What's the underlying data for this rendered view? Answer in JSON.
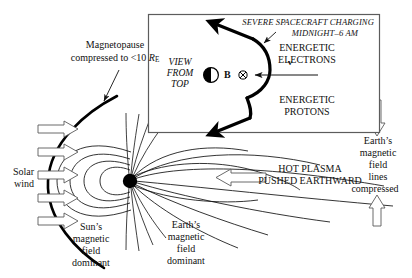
{
  "figure": {
    "background_color": "#ffffff",
    "ink_color": "#111111",
    "width": 412,
    "height": 278
  },
  "inset": {
    "name": "view-from-top-inset",
    "border_color": "#4a4a4a",
    "heading": "SEVERE SPACECRAFT CHARGING",
    "subheading": "MIDNIGHT–6 AM",
    "view_label_line1": "VIEW",
    "view_label_line2": "FROM",
    "view_label_line3": "TOP",
    "field_symbol_label": "B",
    "into_page_symbol": "⊗",
    "velocity_label": "v",
    "electrons_line1": "ENERGETIC",
    "electrons_line2": "ELECTRONS",
    "protons_line1": "ENERGETIC",
    "protons_line2": "PROTONS"
  },
  "labels": {
    "magnetopause_line1": "Magnetopause",
    "magnetopause_line2_pre": "compressed to <10 ",
    "magnetopause_line2_var": "R",
    "magnetopause_line2_sub": "E",
    "solar_wind_line1": "Solar",
    "solar_wind_line2": "wind",
    "suns_field_line1": "Sun’s",
    "suns_field_line2": "magnetic",
    "suns_field_line3": "field",
    "suns_field_line4": "dominant",
    "earths_field_line1": "Earth’s",
    "earths_field_line2": "magnetic",
    "earths_field_line3": "field",
    "earths_field_line4": "dominant",
    "hot_plasma_line1": "HOT PLASMA",
    "hot_plasma_line2": "PUSHED EARTHWARD",
    "compressed_line1": "Earth’s",
    "compressed_line2": "magnetic",
    "compressed_line3": "field",
    "compressed_line4": "lines",
    "compressed_line5": "compressed"
  },
  "arrows": {
    "solar_wind_count": 5,
    "solar_wind_direction": "right",
    "hot_plasma_direction": "left",
    "compression_top_direction": "down",
    "compression_bottom_direction": "up"
  }
}
